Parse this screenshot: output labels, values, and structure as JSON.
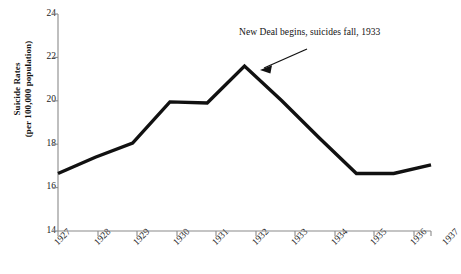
{
  "chart_data": {
    "type": "line",
    "title": "",
    "xlabel": "",
    "ylabel": "Suicide Rates (per 100,000 population)",
    "ylabel_line1": "Suicide Rates",
    "ylabel_line2": "(per 100,000 population)",
    "categories": [
      "1927",
      "1928",
      "1929",
      "1930",
      "1931",
      "1932",
      "1933",
      "1934",
      "1935",
      "1936",
      "1937"
    ],
    "values": [
      16.65,
      17.4,
      18.05,
      19.95,
      19.9,
      21.6,
      20.0,
      18.3,
      16.65,
      16.65,
      17.05
    ],
    "ylim": [
      14,
      24
    ],
    "yticks": [
      "14",
      "16",
      "18",
      "20",
      "22",
      "24"
    ],
    "ytick_values": [
      14,
      16,
      18,
      20,
      22,
      24
    ],
    "grid": false,
    "legend": "none",
    "line_color": "#111111",
    "axis_color": "#8a8a8a",
    "background": "#ffffff",
    "annotations": [
      {
        "text": "New Deal begins, suicides fall, 1933",
        "points_to_year": "1933",
        "points_to_value": 20.0
      }
    ]
  }
}
